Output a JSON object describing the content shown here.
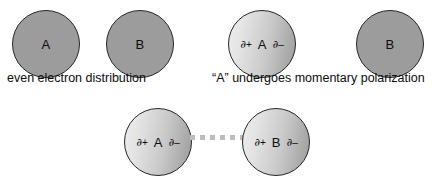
{
  "figure": {
    "background_color": "#ffffff",
    "flat_circle_color": "#9c9c9c",
    "polarized_gradient": {
      "light": "#efefef",
      "dark": "#9d9d9d"
    },
    "outline_color": "#262626",
    "connector_color": "#bdbdbd"
  },
  "top_row": {
    "stage_a": {
      "caption": "even electron distribution",
      "atoms": [
        {
          "label": "A",
          "style": "flat"
        },
        {
          "label": "B",
          "style": "flat"
        }
      ]
    },
    "stage_b": {
      "caption": "“A” undergoes momentary polarization",
      "atoms": [
        {
          "label": "A",
          "style": "polarized",
          "left_charge_symbol": "∂",
          "left_charge_sign": "+",
          "right_charge_symbol": "∂",
          "right_charge_sign": "–"
        },
        {
          "label": "B",
          "style": "flat"
        }
      ]
    }
  },
  "bottom_row": {
    "atoms": [
      {
        "label": "A",
        "style": "polarized",
        "left_charge_symbol": "∂",
        "left_charge_sign": "+",
        "right_charge_symbol": "∂",
        "right_charge_sign": "–"
      },
      {
        "label": "B",
        "style": "polarized",
        "left_charge_symbol": "∂",
        "left_charge_sign": "+",
        "right_charge_symbol": "∂",
        "right_charge_sign": "–"
      }
    ],
    "connector_style": "dotted"
  },
  "clipped_text": {
    "top": "",
    "bottom": ""
  }
}
